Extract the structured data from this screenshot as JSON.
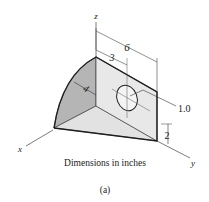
{
  "figure": {
    "caption": "Dimensions in inches",
    "sublabel": "(a)",
    "axes": {
      "x": "x",
      "y": "y",
      "z": "z"
    },
    "dimensions": {
      "total_length": "6",
      "hole_offset": "3",
      "radius": "4",
      "hole_diameter": "1.0",
      "height_offset": "2"
    },
    "colors": {
      "outline": "#2a2a2a",
      "curved_face": "#b5b5b5",
      "top_face": "#e4e4e4",
      "side_face": "#d2d2d2",
      "thin_line": "#444444"
    }
  }
}
